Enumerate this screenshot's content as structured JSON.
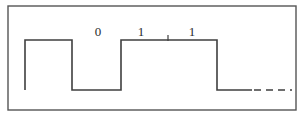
{
  "figure": {
    "kind": "digital-waveform-timing-diagram",
    "background_color": "#ffffff",
    "ink_color": "#3a3a3a",
    "border": {
      "name": "figure-border",
      "x": 8,
      "y": 6,
      "width": 288,
      "height": 104,
      "stroke_width": 1.4,
      "color": "#555555"
    },
    "levels": {
      "high_y": 40,
      "low_y": 90,
      "baseline_start_x": 25,
      "end_x": 292
    },
    "waveform": {
      "name": "signal-trace",
      "stroke_width": 1.6,
      "color": "#3f3f3f",
      "points": [
        [
          25,
          90
        ],
        [
          25,
          40
        ],
        [
          72,
          40
        ],
        [
          72,
          90
        ],
        [
          121,
          90
        ],
        [
          121,
          40
        ],
        [
          217,
          40
        ],
        [
          217,
          90
        ],
        [
          252,
          90
        ]
      ],
      "dashed_tail": {
        "name": "signal-dashed-continuation",
        "from_x": 254,
        "to_x": 292,
        "y": 90,
        "dash_pattern": "7,5"
      },
      "tick_marks": [
        {
          "name": "bit-boundary-tick",
          "x": 168,
          "y_top": 35,
          "y_bottom": 41
        }
      ]
    },
    "bit_labels": [
      {
        "name": "bit-label-0",
        "text": "0",
        "x": 98,
        "y": 25
      },
      {
        "name": "bit-label-1-first",
        "text": "1",
        "x": 141,
        "y": 25
      },
      {
        "name": "bit-label-1-second",
        "text": "1",
        "x": 192,
        "y": 25
      }
    ]
  }
}
